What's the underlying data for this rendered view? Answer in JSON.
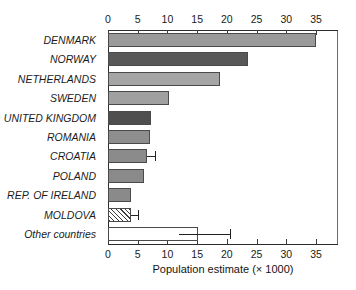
{
  "chart_data": {
    "type": "bar",
    "orientation": "horizontal",
    "title": "",
    "xlabel": "Population estimate (× 1000)",
    "ylabel": "",
    "xlim": [
      0,
      38.7
    ],
    "xticks": [
      0,
      5,
      10,
      15,
      20,
      25,
      30,
      35
    ],
    "xtick_labels": [
      "0",
      "5",
      "10",
      "15",
      "20",
      "25",
      "30",
      "35"
    ],
    "axis_top": true,
    "axis_bottom": true,
    "grid": false,
    "legend": "none",
    "categories": [
      "DENMARK",
      "NORWAY",
      "NETHERLANDS",
      "SWEDEN",
      "UNITED KINGDOM",
      "ROMANIA",
      "CROATIA",
      "POLAND",
      "REP. OF IRELAND",
      "MOLDOVA",
      "Other countries"
    ],
    "values": [
      35.0,
      23.6,
      18.9,
      10.3,
      7.3,
      7.0,
      6.5,
      6.0,
      3.9,
      3.8,
      15.1
    ],
    "bar_fills": [
      "#9a9a9a",
      "#585858",
      "#a5a5a5",
      "#a0a0a0",
      "#4f4f4f",
      "#8e8e8e",
      "#8b8b8b",
      "#8a8a8a",
      "#8a8a8a",
      "hatched",
      "#ffffff"
    ],
    "bar_edge_color": "#4a4a4a",
    "error_bars": [
      {
        "category": "CROATIA",
        "low": 6.5,
        "high": 7.9
      },
      {
        "category": "MOLDOVA",
        "low": 3.8,
        "high": 5.0
      },
      {
        "category": "Other countries",
        "low": 12.0,
        "high": 20.5
      }
    ]
  },
  "axis": {
    "xlabel": "Population estimate (× 1000)"
  },
  "colors": {
    "frame": "#6e6e6e",
    "axis": "#2b2b2b",
    "text": "#1b1b1b",
    "background": "#ffffff"
  }
}
